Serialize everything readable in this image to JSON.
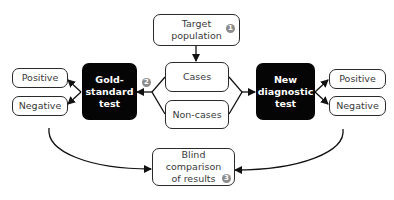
{
  "diagram": {
    "target_population": {
      "label": "Target population",
      "line1": "Target",
      "line2": "population",
      "step": "1"
    },
    "cases": {
      "label": "Cases"
    },
    "non_cases": {
      "label": "Non-cases"
    },
    "gold_standard": {
      "line1": "Gold-",
      "line2": "standard",
      "line3": "test",
      "step": "2"
    },
    "new_test": {
      "line1": "New",
      "line2": "diagnostic",
      "line3": "test"
    },
    "gold_results": {
      "positive": "Positive",
      "negative": "Negative"
    },
    "new_results": {
      "positive": "Positive",
      "negative": "Negative"
    },
    "comparison": {
      "line1": "Blind comparison",
      "line2": "of results",
      "step": "3"
    },
    "colors": {
      "box_border": "#2a2a2a",
      "dark_fill": "#050505",
      "badge": "#8c8c8c",
      "text": "#3a3a3a"
    }
  }
}
